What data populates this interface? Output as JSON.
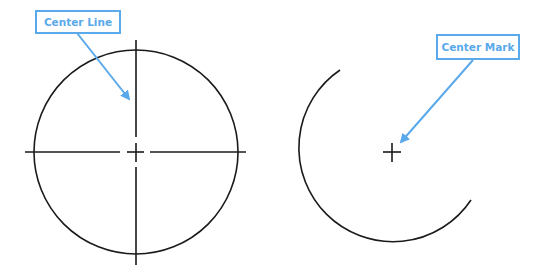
{
  "colors": {
    "annotation": "#5aa9ea",
    "drawing": "#1a1a1a",
    "background": "#ffffff"
  },
  "figures": [
    {
      "name": "full-circle-with-center-lines",
      "label": "Center Line",
      "shape": "circle",
      "center": [
        136,
        152
      ],
      "radius": 102
    },
    {
      "name": "arc-with-center-mark",
      "label": "Center Mark",
      "shape": "arc",
      "center": [
        392,
        152
      ],
      "radius": 94
    }
  ],
  "callouts": {
    "center_line": "Center Line",
    "center_mark": "Center Mark"
  }
}
